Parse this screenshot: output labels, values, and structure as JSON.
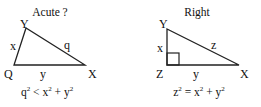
{
  "diagrams": [
    {
      "title": "Acute ?",
      "vertices": {
        "top": "Y",
        "bottom_left": "Q",
        "bottom_right": "X"
      },
      "sides": {
        "left": "x",
        "hypotenuse": "q",
        "base": "y"
      },
      "formula": {
        "lhs_var": "q",
        "exp": "2",
        "op": "<",
        "a": "x",
        "b": "y",
        "plus": "+"
      },
      "stroke_color": "#222222"
    },
    {
      "title": "Right",
      "vertices": {
        "top": "Y",
        "bottom_left": "Z",
        "bottom_right": "X"
      },
      "sides": {
        "left": "x",
        "hypotenuse": "z",
        "base": "y"
      },
      "formula": {
        "lhs_var": "z",
        "exp": "2",
        "op": "=",
        "a": "x",
        "b": "y",
        "plus": "+"
      },
      "right_angle_marker": true,
      "stroke_color": "#222222"
    }
  ]
}
